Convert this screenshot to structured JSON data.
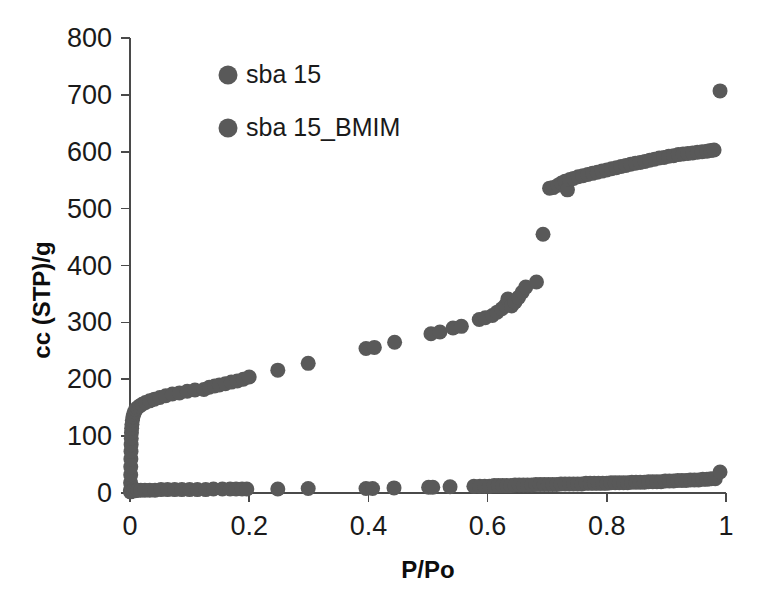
{
  "chart_data": {
    "type": "scatter",
    "title": "",
    "xlabel": "P/Po",
    "ylabel": "cc (STP)/g",
    "xlim": [
      0,
      1
    ],
    "ylim": [
      0,
      800
    ],
    "xticks": [
      "0",
      "0.2",
      "0.4",
      "0.6",
      "0.8",
      "1"
    ],
    "xtick_values": [
      0,
      0.2,
      0.4,
      0.6,
      0.8,
      1
    ],
    "yticks": [
      "0",
      "100",
      "200",
      "300",
      "400",
      "500",
      "600",
      "700",
      "800"
    ],
    "ytick_values": [
      0,
      100,
      200,
      300,
      400,
      500,
      600,
      700,
      800
    ],
    "grid": false,
    "legend_position": "top-left-inside",
    "marker_color": "#595959",
    "marker_radius": 7.5,
    "axis_color": "#4a4a4a",
    "series": [
      {
        "name": "sba 15",
        "color": "#595959",
        "points": [
          [
            0.0008,
            5
          ],
          [
            0.001,
            18
          ],
          [
            0.0012,
            32
          ],
          [
            0.0013,
            46
          ],
          [
            0.0015,
            60
          ],
          [
            0.0017,
            73
          ],
          [
            0.0019,
            85
          ],
          [
            0.0021,
            96
          ],
          [
            0.0024,
            106
          ],
          [
            0.0028,
            114
          ],
          [
            0.0033,
            121
          ],
          [
            0.004,
            128
          ],
          [
            0.005,
            134
          ],
          [
            0.0062,
            139
          ],
          [
            0.0078,
            143
          ],
          [
            0.0098,
            147
          ],
          [
            0.0125,
            150
          ],
          [
            0.016,
            153
          ],
          [
            0.0205,
            156
          ],
          [
            0.026,
            159
          ],
          [
            0.033,
            162
          ],
          [
            0.041,
            165
          ],
          [
            0.05,
            168
          ],
          [
            0.06,
            171
          ],
          [
            0.071,
            174
          ],
          [
            0.083,
            176
          ],
          [
            0.096,
            179
          ],
          [
            0.109,
            181
          ],
          [
            0.124,
            182
          ],
          [
            0.133,
            186
          ],
          [
            0.142,
            188
          ],
          [
            0.15,
            190
          ],
          [
            0.16,
            192
          ],
          [
            0.17,
            195
          ],
          [
            0.18,
            197
          ],
          [
            0.19,
            200
          ],
          [
            0.2,
            204
          ],
          [
            0.248,
            216
          ],
          [
            0.299,
            228
          ],
          [
            0.396,
            254
          ],
          [
            0.41,
            256
          ],
          [
            0.444,
            265
          ],
          [
            0.505,
            280
          ],
          [
            0.52,
            283
          ],
          [
            0.542,
            290
          ],
          [
            0.556,
            293
          ],
          [
            0.586,
            305
          ],
          [
            0.596,
            308
          ],
          [
            0.608,
            312
          ],
          [
            0.616,
            318
          ],
          [
            0.624,
            324
          ],
          [
            0.63,
            330
          ],
          [
            0.634,
            341
          ],
          [
            0.64,
            329
          ],
          [
            0.646,
            336
          ],
          [
            0.652,
            344
          ],
          [
            0.658,
            353
          ],
          [
            0.664,
            362
          ],
          [
            0.682,
            371
          ],
          [
            0.693,
            455
          ],
          [
            0.704,
            536
          ],
          [
            0.71,
            537
          ],
          [
            0.718,
            541
          ],
          [
            0.724,
            545
          ],
          [
            0.73,
            548
          ],
          [
            0.734,
            533
          ],
          [
            0.738,
            551
          ],
          [
            0.744,
            553
          ],
          [
            0.752,
            556
          ],
          [
            0.76,
            558
          ],
          [
            0.768,
            560
          ],
          [
            0.776,
            562
          ],
          [
            0.784,
            564
          ],
          [
            0.792,
            566
          ],
          [
            0.8,
            568
          ],
          [
            0.808,
            570
          ],
          [
            0.816,
            572
          ],
          [
            0.824,
            574
          ],
          [
            0.832,
            576
          ],
          [
            0.84,
            578
          ],
          [
            0.848,
            580
          ],
          [
            0.856,
            581
          ],
          [
            0.864,
            583
          ],
          [
            0.872,
            585
          ],
          [
            0.88,
            587
          ],
          [
            0.888,
            589
          ],
          [
            0.896,
            590
          ],
          [
            0.904,
            592
          ],
          [
            0.912,
            593
          ],
          [
            0.92,
            595
          ],
          [
            0.928,
            596
          ],
          [
            0.936,
            597
          ],
          [
            0.944,
            598
          ],
          [
            0.952,
            599
          ],
          [
            0.96,
            600
          ],
          [
            0.968,
            601
          ],
          [
            0.974,
            602
          ],
          [
            0.98,
            603
          ],
          [
            0.99,
            707
          ]
        ]
      },
      {
        "name": "sba 15_BMIM",
        "color": "#595959",
        "points": [
          [
            0.0008,
            2
          ],
          [
            0.0015,
            3
          ],
          [
            0.0025,
            3
          ],
          [
            0.004,
            4
          ],
          [
            0.006,
            4
          ],
          [
            0.009,
            4
          ],
          [
            0.013,
            5
          ],
          [
            0.018,
            5
          ],
          [
            0.025,
            5
          ],
          [
            0.033,
            5
          ],
          [
            0.042,
            5
          ],
          [
            0.052,
            6
          ],
          [
            0.063,
            6
          ],
          [
            0.075,
            6
          ],
          [
            0.087,
            6
          ],
          [
            0.1,
            6
          ],
          [
            0.113,
            6
          ],
          [
            0.127,
            6
          ],
          [
            0.14,
            7
          ],
          [
            0.155,
            7
          ],
          [
            0.168,
            7
          ],
          [
            0.178,
            7
          ],
          [
            0.188,
            7
          ],
          [
            0.196,
            7
          ],
          [
            0.248,
            7
          ],
          [
            0.299,
            8
          ],
          [
            0.396,
            8
          ],
          [
            0.407,
            8
          ],
          [
            0.443,
            9
          ],
          [
            0.501,
            10
          ],
          [
            0.508,
            10
          ],
          [
            0.537,
            11
          ],
          [
            0.577,
            12
          ],
          [
            0.587,
            12
          ],
          [
            0.595,
            12
          ],
          [
            0.603,
            12
          ],
          [
            0.611,
            13
          ],
          [
            0.618,
            13
          ],
          [
            0.625,
            13
          ],
          [
            0.632,
            13
          ],
          [
            0.639,
            13
          ],
          [
            0.646,
            14
          ],
          [
            0.653,
            14
          ],
          [
            0.66,
            14
          ],
          [
            0.667,
            14
          ],
          [
            0.674,
            14
          ],
          [
            0.681,
            15
          ],
          [
            0.688,
            15
          ],
          [
            0.695,
            15
          ],
          [
            0.702,
            15
          ],
          [
            0.709,
            15
          ],
          [
            0.716,
            15
          ],
          [
            0.723,
            16
          ],
          [
            0.73,
            16
          ],
          [
            0.737,
            16
          ],
          [
            0.744,
            16
          ],
          [
            0.751,
            16
          ],
          [
            0.758,
            16
          ],
          [
            0.765,
            17
          ],
          [
            0.772,
            17
          ],
          [
            0.779,
            17
          ],
          [
            0.786,
            17
          ],
          [
            0.793,
            17
          ],
          [
            0.8,
            17
          ],
          [
            0.807,
            18
          ],
          [
            0.814,
            18
          ],
          [
            0.821,
            18
          ],
          [
            0.828,
            18
          ],
          [
            0.835,
            18
          ],
          [
            0.842,
            19
          ],
          [
            0.849,
            19
          ],
          [
            0.856,
            19
          ],
          [
            0.863,
            19
          ],
          [
            0.87,
            20
          ],
          [
            0.877,
            20
          ],
          [
            0.884,
            20
          ],
          [
            0.891,
            20
          ],
          [
            0.898,
            21
          ],
          [
            0.905,
            21
          ],
          [
            0.912,
            21
          ],
          [
            0.919,
            22
          ],
          [
            0.926,
            22
          ],
          [
            0.933,
            22
          ],
          [
            0.94,
            23
          ],
          [
            0.947,
            23
          ],
          [
            0.954,
            23
          ],
          [
            0.961,
            24
          ],
          [
            0.968,
            24
          ],
          [
            0.975,
            25
          ],
          [
            0.982,
            25
          ],
          [
            0.99,
            37
          ]
        ]
      }
    ],
    "legend": [
      {
        "label": "sba 15",
        "color": "#595959"
      },
      {
        "label": "sba 15_BMIM",
        "color": "#595959"
      }
    ]
  }
}
